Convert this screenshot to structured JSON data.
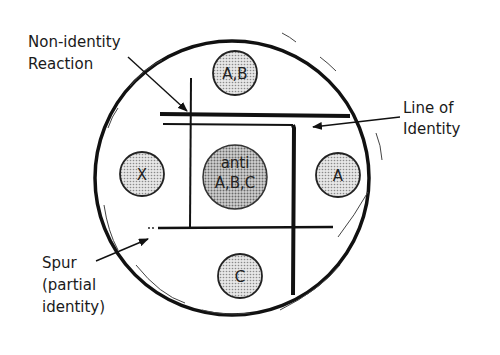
{
  "diagram": {
    "center_well": {
      "line1": "anti",
      "line2": "A,B,C"
    },
    "wells": {
      "top": "A,B",
      "left": "X",
      "right": "A",
      "bottom": "C"
    },
    "labels": {
      "non_identity": {
        "line1": "Non-identity",
        "line2": "Reaction"
      },
      "line_of_identity": {
        "line1": "Line of",
        "line2": "Identity"
      },
      "spur": {
        "line1": "Spur",
        "line2": "(partial",
        "line3": "identity)"
      }
    },
    "colors": {
      "ink": "#111111",
      "well_fill": "#cfcfcf",
      "center_fill": "#b5b5b5"
    }
  }
}
